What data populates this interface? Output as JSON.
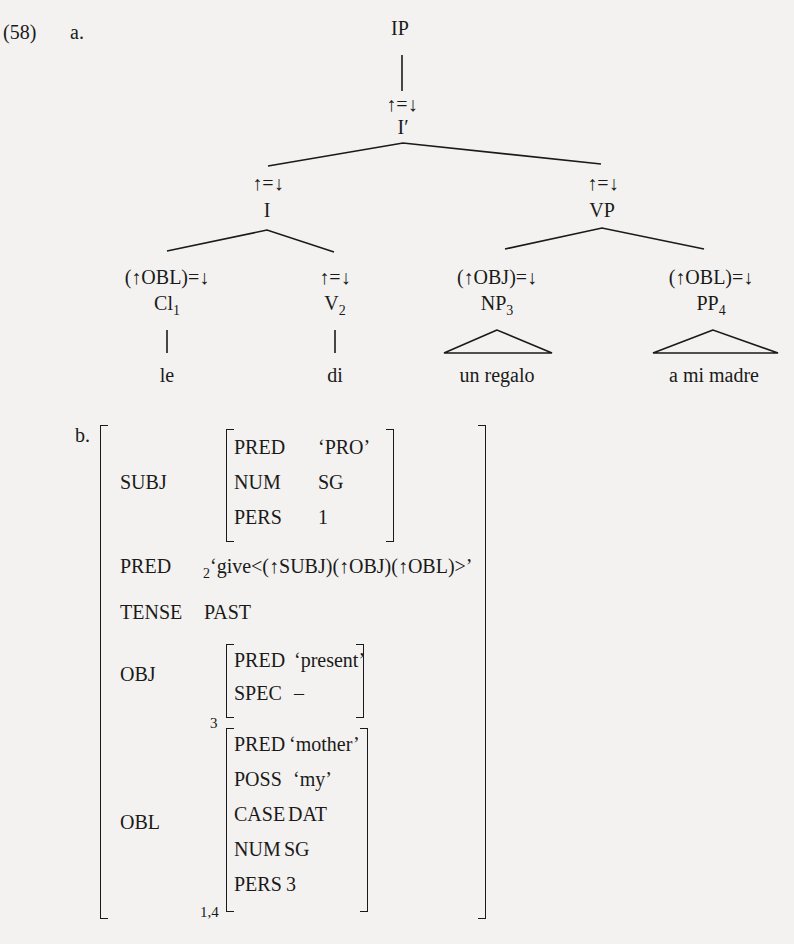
{
  "example": {
    "number": "(58)",
    "part_a_label": "a.",
    "part_b_label": "b."
  },
  "tree": {
    "root": {
      "label": "IP"
    },
    "ibar": {
      "annotation": "↑=↓",
      "label": "I′"
    },
    "i": {
      "annotation": "↑=↓",
      "label": "I"
    },
    "vp": {
      "annotation": "↑=↓",
      "label": "VP"
    },
    "cl": {
      "annotation": "(↑OBL)=↓",
      "label": "Cl",
      "index": "1",
      "leaf": "le"
    },
    "v": {
      "annotation": "↑=↓",
      "label": "V",
      "index": "2",
      "leaf": "di"
    },
    "np": {
      "annotation": "(↑OBJ)=↓",
      "label": "NP",
      "index": "3",
      "leaf": "un regalo"
    },
    "pp": {
      "annotation": "(↑OBL)=↓",
      "label": "PP",
      "index": "4",
      "leaf": "a mi madre"
    }
  },
  "fstructure": {
    "subj": {
      "attr": "SUBJ",
      "rows": [
        {
          "attr": "PRED",
          "value": "‘PRO’"
        },
        {
          "attr": "NUM",
          "value": "SG"
        },
        {
          "attr": "PERS",
          "value": "1"
        }
      ]
    },
    "pred": {
      "attr": "PRED",
      "index": "2",
      "value": "‘give<(↑SUBJ)(↑OBJ)(↑OBL)>’"
    },
    "tense": {
      "attr": "TENSE",
      "value": "PAST"
    },
    "obj": {
      "attr": "OBJ",
      "index": "3",
      "rows": [
        {
          "attr": "PRED",
          "value": "‘present’"
        },
        {
          "attr": "SPEC",
          "value": "–"
        }
      ]
    },
    "obl": {
      "attr": "OBL",
      "index": "1,4",
      "rows": [
        {
          "attr": "PRED",
          "value": "‘mother’"
        },
        {
          "attr": "POSS",
          "value": "‘my’"
        },
        {
          "attr": "CASE",
          "value": "DAT"
        },
        {
          "attr": "NUM",
          "value": "SG"
        },
        {
          "attr": "PERS",
          "value": "3"
        }
      ]
    }
  }
}
